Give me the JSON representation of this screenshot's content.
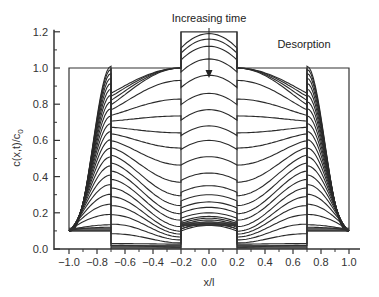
{
  "chart_data": {
    "type": "line",
    "title": "",
    "xlabel": "x/l",
    "ylabel": "c(x,t)/c0",
    "xlim": [
      -1.05,
      1.05
    ],
    "ylim": [
      0.0,
      1.2
    ],
    "x_ticks": [
      -1.0,
      -0.8,
      -0.6,
      -0.4,
      -0.2,
      0.0,
      0.2,
      0.4,
      0.6,
      0.8,
      1.0
    ],
    "x_tick_labels": [
      "−1.0",
      "−0.8",
      "−0.6",
      "−0.4",
      "−0.2",
      "0.0",
      "0.2",
      "0.4",
      "0.6",
      "0.8",
      "1.0"
    ],
    "y_ticks": [
      0.0,
      0.2,
      0.4,
      0.6,
      0.8,
      1.0,
      1.2
    ],
    "y_tick_labels": [
      "0.0",
      "0.2",
      "0.4",
      "0.6",
      "0.8",
      "1.0",
      "1.2"
    ],
    "grid": false,
    "legend": null,
    "annotations": [
      {
        "text": "Increasing time",
        "x": 0.0,
        "y": 1.22,
        "arrow_from_y": 1.2,
        "arrow_to_y": 0.97
      },
      {
        "text": "Desorption",
        "x": 0.58,
        "y": 1.1
      }
    ],
    "regions": [
      {
        "name": "outer-left",
        "x_range": [
          -1.0,
          -0.7
        ],
        "initial": 1.0,
        "final": 0.1
      },
      {
        "name": "middle-left",
        "x_range": [
          -0.7,
          -0.2
        ],
        "initial": 1.0,
        "final": 0.0
      },
      {
        "name": "center",
        "x_range": [
          -0.2,
          0.2
        ],
        "initial": 1.2,
        "final": 0.13
      },
      {
        "name": "middle-right",
        "x_range": [
          0.2,
          0.7
        ],
        "initial": 1.0,
        "final": 0.0
      },
      {
        "name": "outer-right",
        "x_range": [
          0.7,
          1.0
        ],
        "initial": 1.0,
        "final": 0.1
      }
    ],
    "series_description": "Family of concentration profiles c(x,t)/c0 vs x/l at increasing times during desorption from a symmetric multilayer slab; profiles decay from initial step (1.0 outer/middle, 1.2 center) toward final equilibrium values (0.1 outer, 0.0 middle, ~0.13 center).",
    "center_profile_levels": [
      1.19,
      1.16,
      1.12,
      1.05,
      0.96,
      0.86,
      0.77,
      0.68,
      0.6,
      0.51,
      0.42,
      0.35,
      0.3,
      0.26,
      0.23,
      0.2,
      0.18,
      0.17,
      0.16,
      0.15,
      0.14,
      0.14,
      0.13
    ],
    "n_curves": 23
  },
  "annotation_text": {
    "increasing_time": "Increasing time",
    "desorption": "Desorption"
  }
}
